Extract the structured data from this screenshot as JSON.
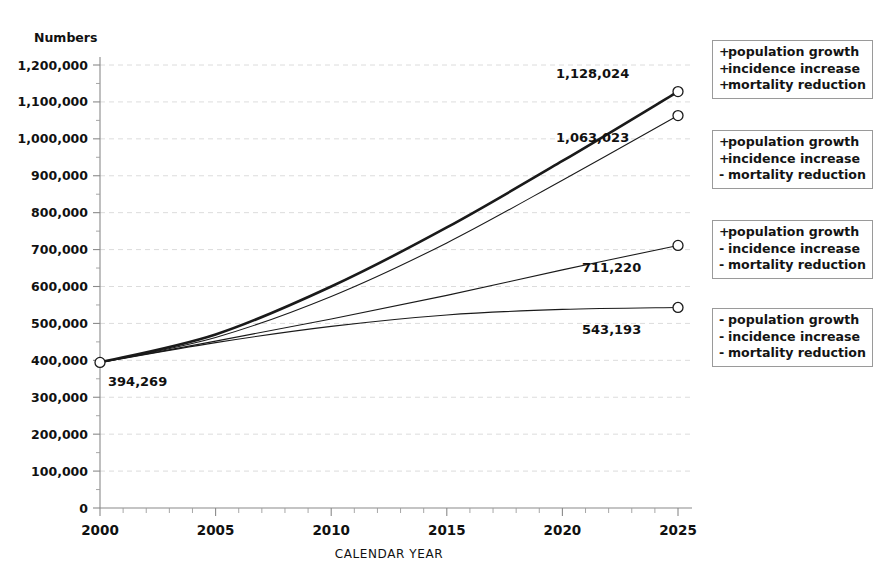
{
  "chart_data": {
    "type": "line",
    "title": "",
    "xlabel": "CALENDAR YEAR",
    "ylabel": "Numbers",
    "x": [
      2000,
      2025
    ],
    "xlim": [
      2000,
      2025
    ],
    "ylim": [
      0,
      1200000
    ],
    "x_ticks": [
      2000,
      2005,
      2010,
      2015,
      2020,
      2025
    ],
    "x_tick_labels": [
      "2000",
      "2005",
      "2010",
      "2015",
      "2020",
      "2025"
    ],
    "x_minor_tick_step": 1,
    "y_ticks": [
      0,
      100000,
      200000,
      300000,
      400000,
      500000,
      600000,
      700000,
      800000,
      900000,
      1000000,
      1100000,
      1200000
    ],
    "y_tick_labels": [
      "0",
      "100,000",
      "200,000",
      "300,000",
      "400,000",
      "500,000",
      "600,000",
      "700,000",
      "800,000",
      "900,000",
      "1,000,000",
      "1,100,000",
      "1,200,000"
    ],
    "y_minor_tick_step": 50000,
    "grid": "horizontal-major-dashed",
    "legend_position": "right-outside",
    "start_value": 394269,
    "start_label": "394,269",
    "series": [
      {
        "name": "+ population growth / + incidence increase / + mortality reduction",
        "legend_index": 0,
        "line_weight": 2.6,
        "end_value": 1128024,
        "end_label": "1,128,024",
        "points": [
          [
            2000,
            394269
          ],
          [
            2005,
            470000
          ],
          [
            2010,
            600000
          ],
          [
            2015,
            760000
          ],
          [
            2020,
            940000
          ],
          [
            2025,
            1128024
          ]
        ]
      },
      {
        "name": "+ population growth / + incidence increase / - mortality reduction",
        "legend_index": 1,
        "line_weight": 1.1,
        "end_value": 1063023,
        "end_label": "1,063,023",
        "points": [
          [
            2000,
            394269
          ],
          [
            2005,
            462000
          ],
          [
            2010,
            573000
          ],
          [
            2015,
            718000
          ],
          [
            2020,
            888000
          ],
          [
            2025,
            1063023
          ]
        ]
      },
      {
        "name": "+ population growth / - incidence increase / - mortality reduction",
        "legend_index": 2,
        "line_weight": 1.1,
        "end_value": 711220,
        "end_label": "711,220",
        "points": [
          [
            2000,
            394269
          ],
          [
            2005,
            452000
          ],
          [
            2010,
            512000
          ],
          [
            2015,
            576000
          ],
          [
            2020,
            645000
          ],
          [
            2025,
            711220
          ]
        ]
      },
      {
        "name": "- population growth / - incidence increase / - mortality reduction",
        "legend_index": 3,
        "line_weight": 1.1,
        "end_value": 543193,
        "end_label": "543,193",
        "points": [
          [
            2000,
            394269
          ],
          [
            2005,
            448000
          ],
          [
            2010,
            492000
          ],
          [
            2015,
            523000
          ],
          [
            2020,
            538000
          ],
          [
            2025,
            543193
          ]
        ]
      }
    ]
  },
  "legend": {
    "boxes": [
      {
        "rows": [
          {
            "sign": "+",
            "text": "population growth"
          },
          {
            "sign": "+",
            "text": "incidence increase"
          },
          {
            "sign": "+",
            "text": "mortality reduction"
          }
        ]
      },
      {
        "rows": [
          {
            "sign": "+",
            "text": "population growth"
          },
          {
            "sign": "+",
            "text": "incidence increase"
          },
          {
            "sign": "-",
            "text": "mortality reduction"
          }
        ]
      },
      {
        "rows": [
          {
            "sign": "+",
            "text": "population growth"
          },
          {
            "sign": "-",
            "text": "incidence increase"
          },
          {
            "sign": "-",
            "text": "mortality reduction"
          }
        ]
      },
      {
        "rows": [
          {
            "sign": "-",
            "text": "population growth"
          },
          {
            "sign": "-",
            "text": "incidence increase"
          },
          {
            "sign": "-",
            "text": "mortality reduction"
          }
        ]
      }
    ]
  },
  "colors": {
    "line": "#1a1a1a",
    "axis": "#8a8a8a",
    "grid": "#d8d8d8",
    "text": "#111111",
    "legend_border": "#9a9a9a",
    "background": "#ffffff"
  }
}
